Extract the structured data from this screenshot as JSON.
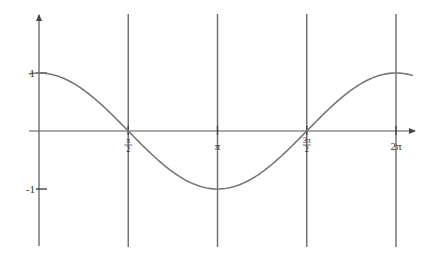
{
  "chart_data": {
    "type": "line",
    "title": "",
    "xlabel": "",
    "ylabel": "",
    "function": "cos(x)",
    "series": [
      {
        "name": "cos(x)",
        "x_range": [
          -0.18,
          6.58
        ],
        "samples": [
          {
            "x": 0,
            "y": 1
          },
          {
            "x": 1.5708,
            "y": 0
          },
          {
            "x": 3.1416,
            "y": -1
          },
          {
            "x": 4.7124,
            "y": 0
          },
          {
            "x": 6.2832,
            "y": 1
          }
        ]
      }
    ],
    "xlim": [
      -0.18,
      6.7
    ],
    "ylim": [
      -2.0,
      2.2
    ],
    "x_ticks": [
      {
        "value": 1.5708,
        "label": "π/2",
        "num": "π",
        "den": "2"
      },
      {
        "value": 3.1416,
        "label": "π"
      },
      {
        "value": 4.7124,
        "label": "3π/2",
        "num": "3π",
        "den": "2"
      },
      {
        "value": 6.2832,
        "label": "2π"
      }
    ],
    "y_ticks": [
      {
        "value": 1,
        "label": "1"
      },
      {
        "value": -1,
        "label": "-1"
      }
    ],
    "vertical_lines_at": [
      1.5708,
      3.1416,
      4.7124,
      6.2832
    ],
    "grid": false,
    "legend": "none"
  }
}
